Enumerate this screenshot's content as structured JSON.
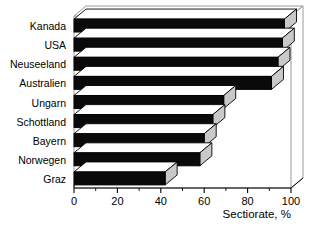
{
  "chart_data": {
    "type": "bar",
    "orientation": "horizontal",
    "title": "",
    "subtitle": "",
    "xlabel": "Sectiorate, %",
    "ylabel": "",
    "categories": [
      "Kanada",
      "USA",
      "Neuseeland",
      "Australien",
      "Ungarn",
      "Schottland",
      "Bayern",
      "Norwegen",
      "Graz"
    ],
    "values": [
      97,
      96,
      94,
      91,
      69,
      64,
      60,
      58,
      42
    ],
    "xlim": [
      0,
      100
    ],
    "xticks": [
      0,
      20,
      40,
      60,
      80,
      100
    ],
    "xtick_labels": [
      "0",
      "20",
      "40",
      "60",
      "80",
      "100"
    ],
    "minor_xticks": [
      10,
      30,
      50,
      70,
      90
    ],
    "grid": false,
    "legend": false,
    "style": "3d-shaded-bars",
    "bar_fill_color": "#0a0a0a",
    "bar_top_color": "#ffffff",
    "bar_side_color": "#c9c9c9",
    "background_color": "#ffffff",
    "axis_color": "#000000"
  },
  "axis": {
    "x_title": "Sectiorate, %",
    "tick_0": "0",
    "tick_20": "20",
    "tick_40": "40",
    "tick_60": "60",
    "tick_80": "80",
    "tick_100": "100"
  },
  "categories": {
    "c0": "Kanada",
    "c1": "USA",
    "c2": "Neuseeland",
    "c3": "Australien",
    "c4": "Ungarn",
    "c5": "Schottland",
    "c6": "Bayern",
    "c7": "Norwegen",
    "c8": "Graz"
  }
}
